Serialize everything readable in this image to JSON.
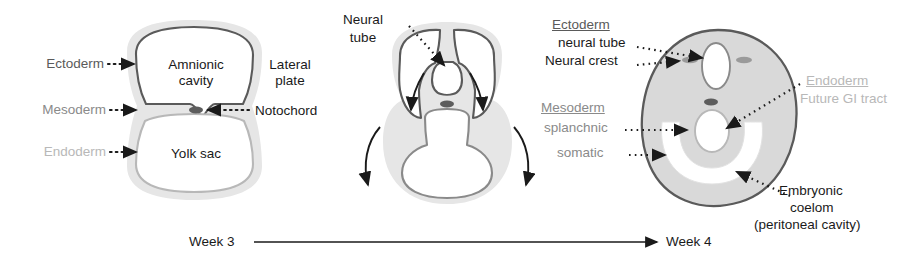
{
  "figure": {
    "type": "embryology-cross-section-series"
  },
  "colors": {
    "ectoderm": "#5a5a5a",
    "mesoderm": "#8a8a8a",
    "endoderm": "#b8b8b8",
    "tissue_fill": "#d9d9d9",
    "halo_fill": "#e6e6e6",
    "outline": "#6b6b6b",
    "text": "#1a1a1a",
    "background": "#ffffff"
  },
  "panel_left": {
    "name": "Week 3 bilaminar disc",
    "labels": {
      "ectoderm": "Ectoderm",
      "mesoderm": "Mesoderm",
      "endoderm": "Endoderm",
      "amnionic_cavity_line1": "Amnionic",
      "amnionic_cavity_line2": "cavity",
      "lateral_plate_line1": "Lateral",
      "lateral_plate_line2": "plate",
      "notochord": "Notochord",
      "yolk_sac": "Yolk sac"
    }
  },
  "panel_middle": {
    "name": "Neural tube closure and folding",
    "labels": {
      "neural_tube_line1": "Neural",
      "neural_tube_line2": "tube"
    }
  },
  "panel_right": {
    "name": "Week 4 trilaminar embryo",
    "ectoderm_group": {
      "header": "Ectoderm",
      "items": [
        "neural tube",
        "Neural crest"
      ]
    },
    "mesoderm_group": {
      "header": "Mesoderm",
      "items": [
        "splanchnic",
        "somatic"
      ]
    },
    "endoderm_group": {
      "header": "Endoderm",
      "items": [
        "Future GI tract"
      ]
    },
    "coelom": {
      "line1": "Embryonic",
      "line2": "coelom",
      "line3": "(peritoneal cavity)"
    }
  },
  "timeline": {
    "start_label": "Week 3",
    "end_label": "Week 4"
  }
}
